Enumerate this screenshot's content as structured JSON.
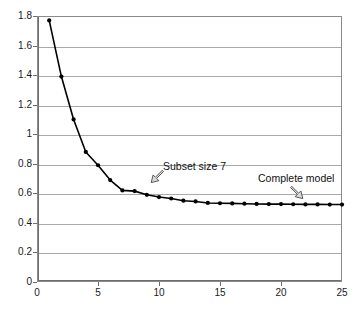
{
  "chart_data": {
    "type": "line",
    "title": "",
    "xlabel": "",
    "ylabel": "",
    "xlim": [
      0,
      25
    ],
    "ylim": [
      0,
      1.8
    ],
    "grid": true,
    "legend": null,
    "marker": "filled-circle",
    "line_color": "#000000",
    "grid_color": "#a9a9a9",
    "x_ticks": [
      "0",
      "5",
      "10",
      "15",
      "20",
      "25"
    ],
    "x_tick_values": [
      0,
      5,
      10,
      15,
      20,
      25
    ],
    "y_ticks": [
      "0",
      "0.2",
      "0.4",
      "0.6",
      "0.8",
      "1",
      "1.2",
      "1.4",
      "1.6",
      "1.8"
    ],
    "y_tick_values": [
      0,
      0.2,
      0.4,
      0.6,
      0.8,
      1.0,
      1.2,
      1.4,
      1.6,
      1.8
    ],
    "x": [
      1,
      2,
      3,
      4,
      5,
      6,
      7,
      8,
      9,
      10,
      11,
      12,
      13,
      14,
      15,
      16,
      17,
      18,
      19,
      20,
      21,
      22,
      23,
      24,
      25
    ],
    "values": [
      1.77,
      1.39,
      1.1,
      0.88,
      0.79,
      0.69,
      0.62,
      0.615,
      0.59,
      0.575,
      0.565,
      0.55,
      0.545,
      0.535,
      0.533,
      0.532,
      0.53,
      0.528,
      0.527,
      0.527,
      0.526,
      0.525,
      0.525,
      0.524,
      0.524
    ],
    "annotations": [
      {
        "text": "Subset size 7",
        "points_to_x": 7,
        "points_to_y": 0.62,
        "arrow": "down-left"
      },
      {
        "text": "Complete model",
        "points_to_x": 25,
        "points_to_y": 0.524,
        "arrow": "down-right"
      }
    ]
  }
}
